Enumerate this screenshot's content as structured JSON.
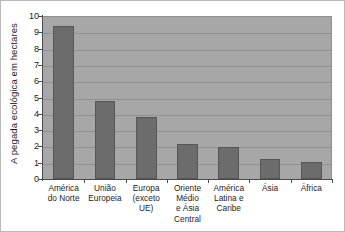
{
  "chart_data": {
    "type": "bar",
    "title": "",
    "xlabel": "",
    "ylabel": "A pegada ecológica em hectares",
    "ylim": [
      0,
      10
    ],
    "ytick_labels": [
      "10",
      "9",
      "8",
      "7",
      "6",
      "5",
      "4",
      "3",
      "2",
      "1",
      "0"
    ],
    "ytick_values": [
      10,
      9,
      8,
      7,
      6,
      5,
      4,
      3,
      2,
      1,
      0
    ],
    "grid": true,
    "legend": "none",
    "categories": [
      "América do Norte",
      "União Europeia",
      "Europa (exceto UE)",
      "Oriente Médio e Ásia Central",
      "América Latina e Caribe",
      "Ásia",
      "África"
    ],
    "category_lines": [
      [
        "América",
        "do Norte"
      ],
      [
        "União",
        "Europeia"
      ],
      [
        "Europa",
        "(exceto",
        "UE)"
      ],
      [
        "Oriente",
        "Médio",
        "e Ásia",
        "Central"
      ],
      [
        "América",
        "Latina e",
        "Caribe"
      ],
      [
        "Ásia"
      ],
      [
        "África"
      ]
    ],
    "values": [
      9.4,
      4.8,
      3.8,
      2.15,
      1.95,
      1.25,
      1.05
    ],
    "bar_color": "#6c6c6c",
    "bar_edge_color": "#565656",
    "plot_background": "#a7a7a7",
    "gridline_color": "#919191",
    "axis_color": "#4a4a4a",
    "text_color": "#1d1d1d"
  }
}
